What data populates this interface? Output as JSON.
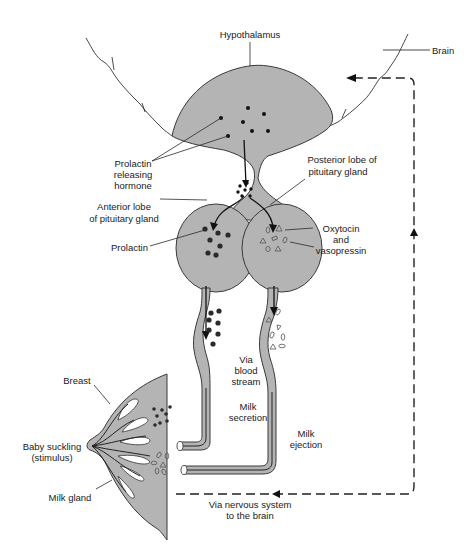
{
  "diagram": {
    "type": "physiology-flow",
    "colors": {
      "tissue_fill": "#b4b4b4",
      "outline": "#3a3a3a",
      "text": "#1a1a1a",
      "background": "#ffffff"
    },
    "labels": {
      "hypothalamus": "Hypothalamus",
      "brain": "Brain",
      "prh_line1": "Prolactin",
      "prh_line2": "releasing",
      "prh_line3": "hormone",
      "posterior_line1": "Posterior lobe of",
      "posterior_line2": "pituitary gland",
      "anterior_line1": "Anterior lobe",
      "anterior_line2": "of pituitary gland",
      "prolactin": "Prolactin",
      "oxy_line1": "Oxytocin",
      "oxy_line2": "and",
      "oxy_line3": "vasopressin",
      "blood_line1": "Via",
      "blood_line2": "blood",
      "blood_line3": "stream",
      "secretion_line1": "Milk",
      "secretion_line2": "secretion",
      "ejection_line1": "Milk",
      "ejection_line2": "ejection",
      "breast": "Breast",
      "suckling_line1": "Baby suckling",
      "suckling_line2": "(stimulus)",
      "milk_gland": "Milk gland",
      "nervous_line1": "Via nervous system",
      "nervous_line2": "to the brain"
    },
    "nodes": [
      "Hypothalamus",
      "Anterior lobe of pituitary gland",
      "Posterior lobe of pituitary gland",
      "Breast"
    ],
    "edges": [
      {
        "from": "Hypothalamus",
        "to": "Anterior lobe of pituitary gland",
        "label": "Prolactin releasing hormone"
      },
      {
        "from": "Hypothalamus",
        "to": "Posterior lobe of pituitary gland",
        "label": ""
      },
      {
        "from": "Anterior lobe of pituitary gland",
        "to": "Breast",
        "label": "Prolactin via blood stream — Milk secretion"
      },
      {
        "from": "Posterior lobe of pituitary gland",
        "to": "Breast",
        "label": "Oxytocin and vasopressin — Milk ejection"
      },
      {
        "from": "Breast",
        "to": "Hypothalamus",
        "label": "Via nervous system to the brain",
        "style": "dashed"
      }
    ]
  }
}
